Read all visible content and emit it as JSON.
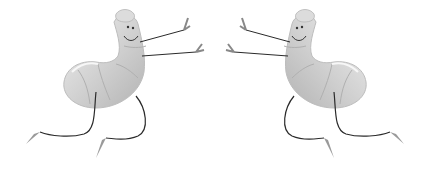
{
  "image": {
    "description": "Two mirrored cartoon shrimp characters dancing with stick arms and legs",
    "background": "#ffffff",
    "colors": {
      "body_light": "#e6e6e6",
      "body_mid": "#cfcfcf",
      "body_dark": "#a9a9a9",
      "limb": "#2a2a2a"
    },
    "figures": [
      {
        "name": "left-shrimp",
        "facing": "right"
      },
      {
        "name": "right-shrimp",
        "facing": "left"
      }
    ]
  }
}
